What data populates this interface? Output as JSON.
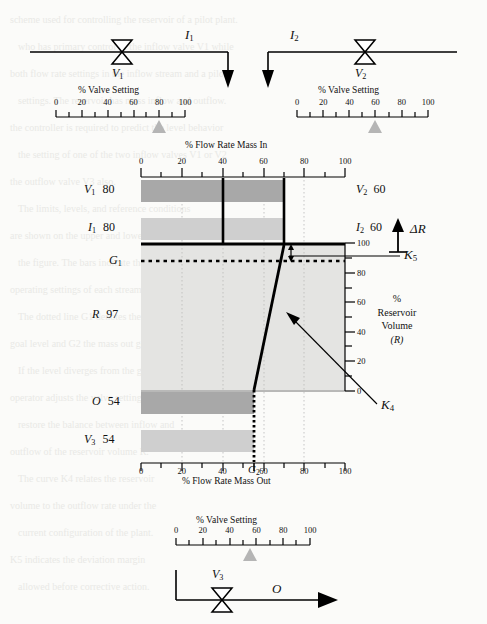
{
  "figure": {
    "background_color": "#fbfbf9",
    "band_dark": "#a8a8a8",
    "band_light": "#cfcfcf",
    "plot_fill": "#e4e4e2",
    "marker_color": "#b5b5b5",
    "line_color": "#000000"
  },
  "top_section": {
    "valve_left": {
      "name_label": "V",
      "name_sub": "1"
    },
    "valve_right": {
      "name_label": "V",
      "name_sub": "2"
    },
    "stream_left": {
      "name_label": "I",
      "name_sub": "1"
    },
    "stream_right": {
      "name_label": "I",
      "name_sub": "2"
    },
    "scale_left": {
      "title": "% Valve Setting",
      "ticks": [
        "0",
        "20",
        "40",
        "60",
        "80",
        "100"
      ],
      "tick_values": [
        0,
        20,
        40,
        60,
        80,
        100
      ],
      "marker_value": 80
    },
    "scale_right": {
      "title": "% Valve Setting",
      "ticks": [
        "0",
        "20",
        "40",
        "60",
        "80",
        "100"
      ],
      "tick_values": [
        0,
        20,
        40,
        60,
        80,
        100
      ],
      "marker_value": 60
    }
  },
  "bottom_section": {
    "valve": {
      "name_label": "V",
      "name_sub": "3"
    },
    "outflow_label": "O",
    "scale": {
      "title": "% Valve Setting",
      "ticks": [
        "0",
        "20",
        "40",
        "60",
        "80",
        "100"
      ],
      "tick_values": [
        0,
        20,
        40,
        60,
        80,
        100
      ],
      "marker_value": 55
    }
  },
  "chart_data": {
    "type": "bar",
    "title": "% Flow Rate Mass In",
    "xlabel_top": "% Flow Rate Mass In",
    "xlabel_bottom": "% Flow Rate Mass Out",
    "xlim": [
      0,
      100
    ],
    "xticks": [
      0,
      20,
      40,
      60,
      80,
      100
    ],
    "xtick_labels": [
      "0",
      "20",
      "40",
      "60",
      "80",
      "100"
    ],
    "grid": true,
    "right_axis": {
      "label_lines": [
        "%",
        "Reservoir",
        "Volume",
        "(R)"
      ],
      "ylim": [
        0,
        100
      ],
      "yticks": [
        0,
        20,
        40,
        60,
        80,
        100
      ],
      "ytick_labels": [
        "0",
        "20",
        "40",
        "60",
        "80",
        "100"
      ]
    },
    "bars_in": [
      {
        "name": "V1",
        "var": "V",
        "sub": "1",
        "value": 80,
        "display": "80",
        "right_var": "V",
        "right_sub": "2",
        "right_value": 60,
        "right_display": "60",
        "bar_extent": 70,
        "shade": "dark"
      },
      {
        "name": "I1",
        "var": "I",
        "sub": "1",
        "value": 80,
        "display": "80",
        "right_var": "I",
        "right_sub": "2",
        "right_value": 60,
        "right_display": "60",
        "bar_extent": 70,
        "shade": "light"
      }
    ],
    "bars_out": [
      {
        "name": "O",
        "var": "O",
        "sub": "",
        "value": 54,
        "display": "54",
        "bar_extent": 54,
        "shade": "dark"
      },
      {
        "name": "V3",
        "var": "V",
        "sub": "3",
        "value": 54,
        "display": "54",
        "bar_extent": 54,
        "shade": "light"
      }
    ],
    "reservoir": {
      "var": "R",
      "sub": "",
      "value": 97,
      "display": "97"
    },
    "markers": {
      "vertical_line_in_a": 40,
      "vertical_line_in_b": 70,
      "vertical_line_out": 54
    },
    "setpoint_G1": {
      "label": "G",
      "sub": "1",
      "reservoir_value": 88,
      "style": "dotted"
    },
    "setpoint_G2": {
      "label": "G",
      "sub": "2",
      "flow_value": 54
    },
    "curve_K4": {
      "label": "K",
      "sub": "4",
      "points": [
        {
          "flow": 70,
          "R": 100
        },
        {
          "flow": 54,
          "R": 0
        },
        {
          "flow": 54,
          "R": -45
        }
      ],
      "note": "solid above R=0, dotted below"
    },
    "annotation_K5": {
      "label": "K",
      "sub": "5"
    },
    "annotation_deltaR": {
      "label": "ΔR"
    }
  },
  "ghost_text": [
    "scheme used for controlling the reservoir of a pilot plant.",
    "who has primary control of the inflow valve V1 while",
    "both flow rate settings in the inflow stream and a pilot",
    "settings. The reservoir has mass inflow and outflow.",
    "the controller is required to predict the level behavior",
    "the setting of one of the two inflow valves V1 or V2",
    "the outflow valve V3 also.",
    "The limits, levels, and reference conditions",
    "are shown on the upper and lower scales in",
    "the figure. The bars indicate the current",
    "operating settings of each stream.",
    "The dotted line G1 denotes the reservoir",
    "goal level and G2 the mass out goal.",
    "If the level diverges from the goal the",
    "operator adjusts the valve settings to",
    "restore the balance between inflow and",
    "outflow of the reservoir volume R.",
    "The curve K4 relates the reservoir",
    "volume to the outflow rate under the",
    "current configuration of the plant.",
    "K5 indicates the deviation margin",
    "allowed before corrective action."
  ]
}
